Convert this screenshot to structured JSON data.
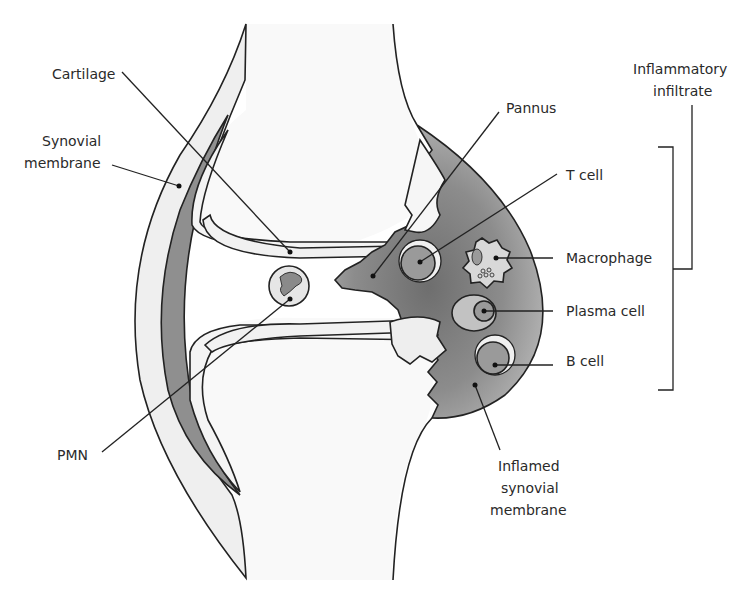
{
  "figure": {
    "colors": {
      "bone": "#f7f7f7",
      "capsule": "#efefef",
      "synovium_dark": "#8a8a8a",
      "synovium_light": "#b9b9b9",
      "cell_fill": "#c9c9c9",
      "outline": "#222222",
      "text": "#2a2a2a"
    }
  },
  "labels": {
    "cartilage": "Cartilage",
    "synovial_membrane_1": "Synovial",
    "synovial_membrane_2": "membrane",
    "pmn": "PMN",
    "pannus": "Pannus",
    "t_cell": "T cell",
    "macrophage": "Macrophage",
    "plasma_cell": "Plasma cell",
    "b_cell": "B cell",
    "inflamed_1": "Inflamed",
    "inflamed_2": "synovial",
    "inflamed_3": "membrane",
    "inflammatory_1": "Inflammatory",
    "inflammatory_2": "infiltrate"
  }
}
